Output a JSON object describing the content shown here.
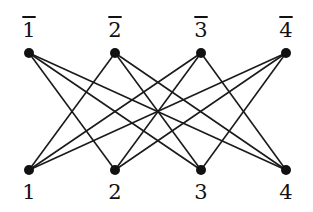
{
  "graph": {
    "type": "crown graph (K4,4 minus perfect matching)",
    "top_nodes": [
      {
        "id": "1bar",
        "label": "1",
        "overline": true,
        "x": 29,
        "y": 53
      },
      {
        "id": "2bar",
        "label": "2",
        "overline": true,
        "x": 115,
        "y": 53
      },
      {
        "id": "3bar",
        "label": "3",
        "overline": true,
        "x": 201,
        "y": 53
      },
      {
        "id": "4bar",
        "label": "4",
        "overline": true,
        "x": 286,
        "y": 53
      }
    ],
    "bottom_nodes": [
      {
        "id": "1",
        "label": "1",
        "overline": false,
        "x": 29,
        "y": 170
      },
      {
        "id": "2",
        "label": "2",
        "overline": false,
        "x": 115,
        "y": 170
      },
      {
        "id": "3",
        "label": "3",
        "overline": false,
        "x": 201,
        "y": 170
      },
      {
        "id": "4",
        "label": "4",
        "overline": false,
        "x": 286,
        "y": 170
      }
    ],
    "edges": [
      [
        "1bar",
        "2"
      ],
      [
        "1bar",
        "3"
      ],
      [
        "1bar",
        "4"
      ],
      [
        "2bar",
        "1"
      ],
      [
        "2bar",
        "3"
      ],
      [
        "2bar",
        "4"
      ],
      [
        "3bar",
        "1"
      ],
      [
        "3bar",
        "2"
      ],
      [
        "3bar",
        "4"
      ],
      [
        "4bar",
        "1"
      ],
      [
        "4bar",
        "2"
      ],
      [
        "4bar",
        "3"
      ]
    ],
    "colors": {
      "edge": "#1a1a1a",
      "node": "#111111",
      "background": "#ffffff"
    }
  }
}
